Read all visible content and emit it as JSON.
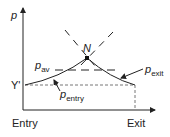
{
  "diagram": {
    "axis_y_label": "p",
    "axis_x_start_label": "Entry",
    "axis_x_end_label": "Exit",
    "y_reference_label": "Y'",
    "peak_label": "N",
    "p_av": {
      "base": "p",
      "sub": "av"
    },
    "p_entry": {
      "base": "p",
      "sub": "entry"
    },
    "p_exit": {
      "base": "p",
      "sub": "exit"
    }
  }
}
